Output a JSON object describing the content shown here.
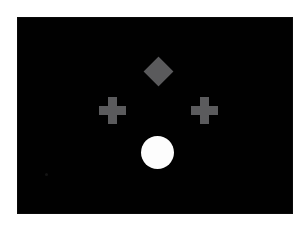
{
  "figure": {
    "title": "",
    "background_color": "#ffffff",
    "panel": {
      "name": "display-panel",
      "background_color": "#010101",
      "left": 18,
      "top": 18,
      "width": 274,
      "height": 195
    },
    "shapes": [
      {
        "id": "diamond",
        "label": "diamond",
        "glyph": "◆",
        "color": "#5a5a5c",
        "position": "top-center",
        "center_x": 158,
        "center_y": 71,
        "width": 29,
        "height": 29
      },
      {
        "id": "cross-left",
        "label": "plus",
        "glyph": "✚",
        "color": "#5b5b5d",
        "position": "middle-left",
        "center_x": 112,
        "center_y": 110,
        "width": 27,
        "height": 27,
        "arm_thickness": 9
      },
      {
        "id": "cross-right",
        "label": "plus",
        "glyph": "✚",
        "color": "#5b5b5d",
        "position": "middle-right",
        "center_x": 204,
        "center_y": 110,
        "width": 27,
        "height": 27,
        "arm_thickness": 9
      },
      {
        "id": "circle",
        "label": "circle",
        "glyph": "●",
        "color": "#fdfdfd",
        "position": "bottom-center",
        "center_x": 157,
        "center_y": 152,
        "diameter": 33
      },
      {
        "id": "speck",
        "label": "noise-speck",
        "color": "#141414",
        "position": "bottom-left",
        "center_x": 46,
        "center_y": 174,
        "diameter": 3
      }
    ]
  }
}
